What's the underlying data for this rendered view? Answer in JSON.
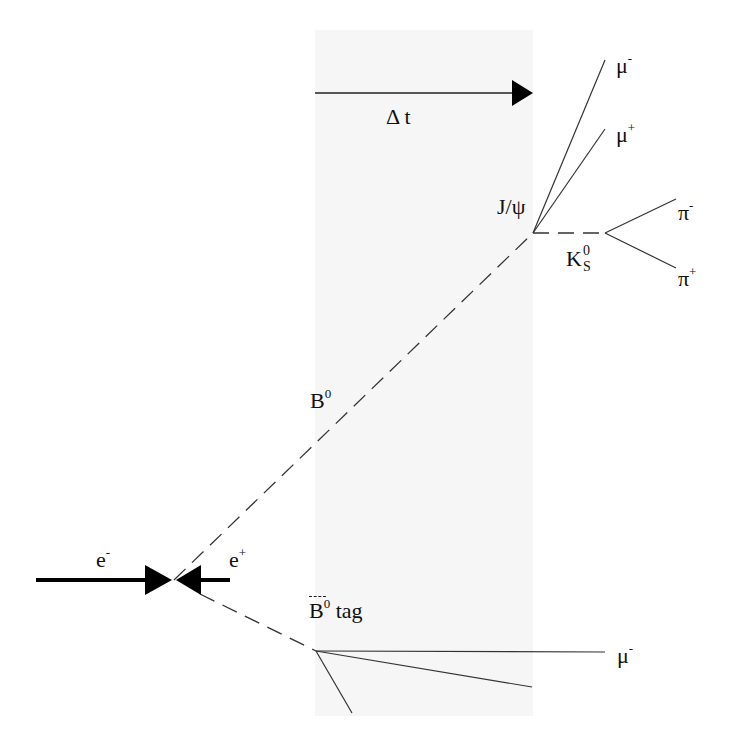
{
  "diagram": {
    "type": "particle-decay-event-topology",
    "background_color": "#ffffff",
    "shaded_region": {
      "x": 315,
      "y": 30,
      "width": 218,
      "height": 686,
      "color": "#f6f6f6"
    },
    "line_color": "#222222",
    "arrow_color": "#000000"
  },
  "labels": {
    "delta_t": "Δ t",
    "e_minus": "e",
    "e_minus_sup": "-",
    "e_plus": "e",
    "e_plus_sup": "+",
    "b0": "B",
    "b0_sup": "0",
    "b0bar_tag": "B",
    "b0bar_tag_sup": "0",
    "b0bar_tag_suffix": " tag",
    "jpsi": "J/ψ",
    "ks0": "K",
    "ks0_sup": "0",
    "ks0_sub": "S",
    "mu_minus_top": "μ",
    "mu_minus_top_sup": "-",
    "mu_plus": "μ",
    "mu_plus_sup": "+",
    "pi_minus": "π",
    "pi_minus_sup": "-",
    "pi_plus": "π",
    "pi_plus_sup": "+",
    "mu_minus_bottom": "μ",
    "mu_minus_bottom_sup": "-"
  },
  "vertices": {
    "collision": {
      "x": 174,
      "y": 580
    },
    "b0_decay": {
      "x": 533,
      "y": 233
    },
    "ks_decay": {
      "x": 605,
      "y": 233
    },
    "tag_decay": {
      "x": 316,
      "y": 651
    }
  }
}
